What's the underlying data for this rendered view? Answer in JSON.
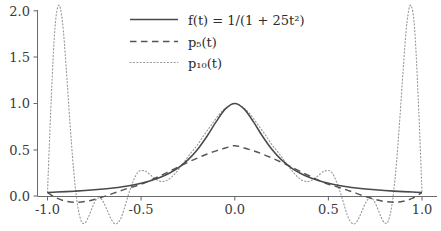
{
  "chart_data": {
    "type": "line",
    "title": "",
    "subtitle": "",
    "xlabel": "",
    "ylabel": "",
    "xlim": [
      -1.08,
      1.04
    ],
    "ylim": [
      -0.12,
      2.12
    ],
    "grid": false,
    "legend_position": "top-center",
    "xticks": [
      -1.0,
      -0.5,
      0.0,
      0.5,
      1.0
    ],
    "xtick_labels": [
      "-1.0",
      "-0.5",
      "0.0",
      "0.5",
      "1.0"
    ],
    "yticks": [
      0.0,
      0.5,
      1.0,
      1.5,
      2.0
    ],
    "ytick_labels": [
      "0.0",
      "0.5",
      "1.0",
      "1.5",
      "2.0"
    ],
    "series": [
      {
        "name": "f(t) = 1/(1 + 25t²)",
        "legend_label": "f(t) = 1/(1 + 25t²)",
        "style": "solid",
        "color": "#4a4a4a",
        "x": [
          -1.0,
          -0.95,
          -0.9,
          -0.85,
          -0.8,
          -0.75,
          -0.7,
          -0.65,
          -0.6,
          -0.55,
          -0.5,
          -0.45,
          -0.4,
          -0.35,
          -0.3,
          -0.25,
          -0.2,
          -0.15,
          -0.1,
          -0.05,
          0.0,
          0.05,
          0.1,
          0.15,
          0.2,
          0.25,
          0.3,
          0.35,
          0.4,
          0.45,
          0.5,
          0.55,
          0.6,
          0.65,
          0.7,
          0.75,
          0.8,
          0.85,
          0.9,
          0.95,
          1.0
        ],
        "y": [
          0.0385,
          0.0424,
          0.0471,
          0.0525,
          0.0588,
          0.0664,
          0.0755,
          0.0864,
          0.1,
          0.1168,
          0.1379,
          0.1649,
          0.2,
          0.2462,
          0.3077,
          0.3902,
          0.5,
          0.64,
          0.8,
          0.9412,
          1.0,
          0.9412,
          0.8,
          0.64,
          0.5,
          0.3902,
          0.3077,
          0.2462,
          0.2,
          0.1649,
          0.1379,
          0.1168,
          0.1,
          0.0864,
          0.0755,
          0.0664,
          0.0588,
          0.0525,
          0.0471,
          0.0424,
          0.0385
        ]
      },
      {
        "name": "p5(t)",
        "legend_label": "p₅(t)",
        "style": "dashed",
        "color": "#555555",
        "x": [
          -1.0,
          -0.95,
          -0.9,
          -0.85,
          -0.8,
          -0.75,
          -0.7,
          -0.65,
          -0.6,
          -0.55,
          -0.5,
          -0.45,
          -0.4,
          -0.35,
          -0.3,
          -0.25,
          -0.2,
          -0.15,
          -0.1,
          -0.05,
          0.0,
          0.05,
          0.1,
          0.15,
          0.2,
          0.25,
          0.3,
          0.35,
          0.4,
          0.45,
          0.5,
          0.55,
          0.6,
          0.65,
          0.7,
          0.75,
          0.8,
          0.85,
          0.9,
          0.95,
          1.0
        ],
        "y": [
          0.0385,
          -0.0232,
          -0.0568,
          -0.0671,
          -0.0589,
          -0.0372,
          -0.0066,
          0.0282,
          0.0635,
          0.0968,
          0.1266,
          0.1692,
          0.2162,
          0.2655,
          0.3152,
          0.3636,
          0.4094,
          0.4512,
          0.4879,
          0.5189,
          0.5437,
          0.5189,
          0.4879,
          0.4512,
          0.4094,
          0.3636,
          0.3152,
          0.2655,
          0.2162,
          0.1692,
          0.1266,
          0.0968,
          0.0635,
          0.0282,
          -0.0066,
          -0.0372,
          -0.0589,
          -0.0671,
          -0.0568,
          -0.0232,
          0.0385
        ]
      },
      {
        "name": "p10(t)",
        "legend_label": "p₁₀(t)",
        "style": "dotted",
        "color": "#9a9a9a",
        "x": [
          -1.0,
          -0.98,
          -0.96,
          -0.94,
          -0.92,
          -0.9,
          -0.88,
          -0.86,
          -0.84,
          -0.82,
          -0.8,
          -0.78,
          -0.76,
          -0.74,
          -0.72,
          -0.7,
          -0.68,
          -0.66,
          -0.64,
          -0.62,
          -0.6,
          -0.56,
          -0.52,
          -0.48,
          -0.44,
          -0.4,
          -0.36,
          -0.32,
          -0.28,
          -0.24,
          -0.2,
          -0.16,
          -0.12,
          -0.08,
          -0.04,
          0.0,
          0.04,
          0.08,
          0.12,
          0.16,
          0.2,
          0.24,
          0.28,
          0.32,
          0.36,
          0.4,
          0.44,
          0.48,
          0.52,
          0.56,
          0.6,
          0.62,
          0.64,
          0.66,
          0.68,
          0.7,
          0.72,
          0.74,
          0.76,
          0.78,
          0.8,
          0.82,
          0.84,
          0.86,
          0.88,
          0.9,
          0.92,
          0.94,
          0.96,
          0.98,
          1.0
        ],
        "y": [
          0.0385,
          1.05,
          1.82,
          2.06,
          1.88,
          1.38,
          0.79,
          0.27,
          -0.09,
          -0.27,
          -0.29,
          -0.22,
          -0.12,
          -0.04,
          -0.02,
          -0.07,
          -0.16,
          -0.25,
          -0.3,
          -0.28,
          -0.2,
          0.06,
          0.25,
          0.27,
          0.21,
          0.16,
          0.17,
          0.24,
          0.34,
          0.45,
          0.55,
          0.67,
          0.78,
          0.89,
          0.96,
          1.0,
          0.96,
          0.89,
          0.78,
          0.67,
          0.55,
          0.45,
          0.34,
          0.24,
          0.17,
          0.16,
          0.21,
          0.27,
          0.25,
          0.06,
          -0.2,
          -0.28,
          -0.3,
          -0.25,
          -0.16,
          -0.07,
          -0.02,
          -0.04,
          -0.12,
          -0.22,
          -0.29,
          -0.27,
          -0.09,
          0.27,
          0.79,
          1.38,
          1.88,
          2.06,
          1.82,
          1.05,
          0.0385
        ]
      }
    ],
    "annotations": []
  },
  "axes": {
    "y_tick_labels": [
      "2.0",
      "1.5",
      "1.0",
      "0.5",
      "0.0"
    ],
    "x_tick_labels": [
      "-1.0",
      "-0.5",
      "0.0",
      "0.5",
      "1.0"
    ]
  },
  "legend": {
    "entries": [
      {
        "label": "f(t) = 1/(1 + 25t²)",
        "style": "solid"
      },
      {
        "label": "p₅(t)",
        "style": "dashed"
      },
      {
        "label": "p₁₀(t)",
        "style": "dotted"
      }
    ]
  },
  "colors": {
    "background": "#ffffff",
    "axis": "#6a6a6a",
    "f_curve": "#4a4a4a",
    "p5_curve": "#555555",
    "p10_curve": "#9a9a9a",
    "text": "#2b2b2b"
  }
}
